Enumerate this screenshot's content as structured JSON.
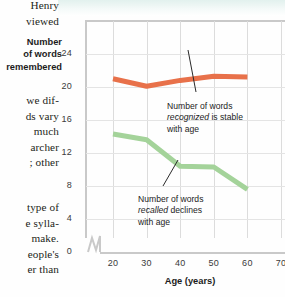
{
  "page": {
    "body_text_top": [
      "Henry",
      "viewed"
    ],
    "body_text_middle": [
      "we dif-",
      "ds vary",
      "much",
      "archer",
      "; other"
    ],
    "body_text_bottom": [
      "type of",
      "e sylla-",
      "make.",
      "eople's",
      "er than"
    ]
  },
  "chart_data": {
    "type": "line",
    "title": "",
    "xlabel": "Age (years)",
    "ylabel": "Number of words remembered",
    "ylabel_lines": [
      "Number",
      "of words",
      "remembered"
    ],
    "xlim": [
      20,
      70
    ],
    "ylim": [
      0,
      26
    ],
    "xticks": [
      20,
      30,
      40,
      50,
      60,
      70
    ],
    "yticks": [
      0,
      4,
      8,
      12,
      16,
      20,
      24
    ],
    "x_axis_break": true,
    "grid": "both",
    "legend": "none",
    "x": [
      20,
      30,
      40,
      50,
      60
    ],
    "series": [
      {
        "name": "Number of words recognized",
        "color": "#e8714a",
        "values": [
          21.0,
          20.1,
          20.8,
          21.3,
          21.2
        ]
      },
      {
        "name": "Number of words recalled",
        "color": "#a4d39a",
        "values": [
          14.3,
          13.6,
          10.4,
          10.3,
          7.6
        ]
      }
    ],
    "annotations": [
      {
        "id": "recognized",
        "lines": [
          "Number of words",
          "recognized is stable",
          "with age"
        ],
        "line1": "Number of words",
        "line2_italic": "recognized",
        "line2_rest": " is stable",
        "line3": "with age",
        "target_series": "Number of words recognized"
      },
      {
        "id": "recalled",
        "lines": [
          "Number of words",
          "recalled declines",
          "with age"
        ],
        "line1": "Number of words",
        "line2_italic": "recalled",
        "line2_rest": " declines",
        "line3": "with age",
        "target_series": "Number of words recalled"
      }
    ]
  },
  "colors": {
    "recognized_line": "#e8714a",
    "recalled_line": "#a4d39a",
    "grid": "#dcdcdc",
    "axis": "#c9c9c9",
    "text": "#1c1c1c",
    "top_band": "#e2f1ee"
  }
}
